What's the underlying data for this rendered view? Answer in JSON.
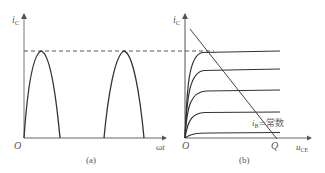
{
  "panel_a": {
    "caption": "(a)",
    "y_axis_label": "i",
    "y_axis_sub": "C",
    "x_axis_label": "ωt",
    "origin_label": "O",
    "description": "Half-wave sinusoidal collector current pulses reaching the dashed peak level"
  },
  "panel_b": {
    "caption": "(b)",
    "y_axis_label": "i",
    "y_axis_sub": "C",
    "x_axis_label": "u",
    "x_axis_sub": "CE",
    "origin_label": "O",
    "q_label": "Q",
    "curve_label_var": "i",
    "curve_label_sub": "B",
    "curve_label_text": "=常数",
    "description": "Transistor output characteristic curves with load line"
  },
  "colors": {
    "curve": "#333333",
    "axis": "#555555",
    "dashed": "#444444"
  }
}
